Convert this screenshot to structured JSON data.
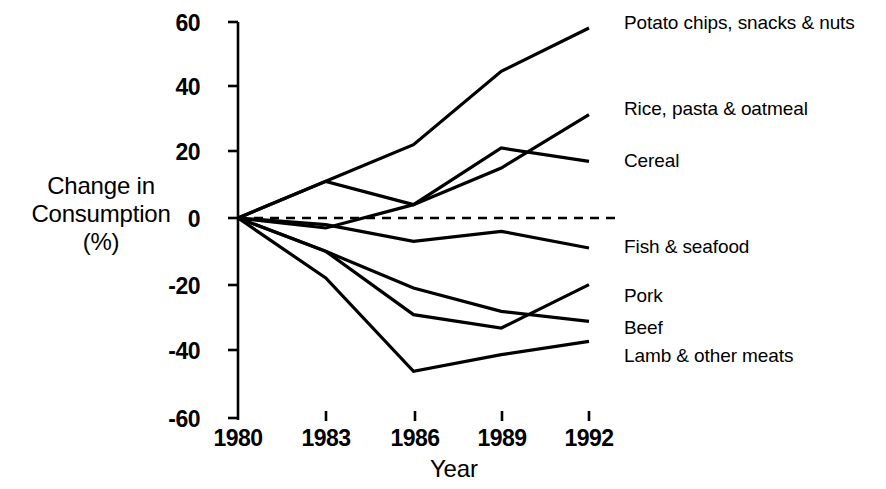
{
  "chart_data": {
    "type": "line",
    "title": "",
    "xlabel": "Year",
    "ylabel": "Change in Consumption (%)",
    "ylabel_lines": [
      "Change in",
      "Consumption",
      "(%)"
    ],
    "x": [
      1980,
      1983,
      1986,
      1989,
      1992
    ],
    "xtick_labels": [
      "1980",
      "1983",
      "1986",
      "1989",
      "1992"
    ],
    "ytick_labels": [
      "60",
      "40",
      "20",
      "0",
      "-20",
      "-40",
      "-60"
    ],
    "yticks": [
      60,
      40,
      20,
      0,
      -20,
      -40,
      -60
    ],
    "ylim": [
      -60,
      60
    ],
    "xlim": [
      1980,
      1992
    ],
    "grid": false,
    "legend_position": "right-inline-labels",
    "zero_reference_line": {
      "value": 0,
      "style": "dashed",
      "label": ""
    },
    "series": [
      {
        "name": "Potato chips, snacks & nuts",
        "values": [
          0,
          11,
          22,
          44,
          57
        ]
      },
      {
        "name": "Rice, pasta & oatmeal",
        "values": [
          0,
          -3,
          4,
          15,
          31
        ]
      },
      {
        "name": "Cereal",
        "values": [
          0,
          11,
          4,
          21,
          17
        ]
      },
      {
        "name": "Fish & seafood",
        "values": [
          0,
          -2,
          -7,
          -4,
          -9
        ]
      },
      {
        "name": "Pork",
        "values": [
          0,
          -10,
          -29,
          -33,
          -20
        ]
      },
      {
        "name": "Beef",
        "values": [
          0,
          -10,
          -21,
          -28,
          -31
        ]
      },
      {
        "name": "Lamb & other meats",
        "values": [
          0,
          -18,
          -46,
          -41,
          -37
        ]
      }
    ]
  },
  "labels": {
    "series_labels": [
      "Potato chips, snacks & nuts",
      "Rice, pasta & oatmeal",
      "Cereal",
      "Fish & seafood",
      "Pork",
      "Beef",
      "Lamb & other meats"
    ]
  },
  "colors": {
    "background": "#ffffff",
    "ink": "#000000"
  }
}
